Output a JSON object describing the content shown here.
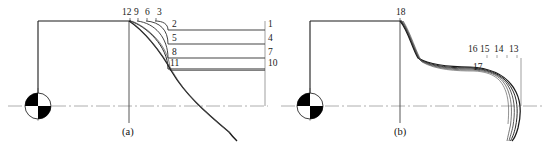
{
  "figure": {
    "width": 549,
    "height": 143,
    "background": "#ffffff",
    "line_color": "#1a1a1a",
    "centerline_color": "#8c8c8c",
    "thin_line_color": "#555555",
    "label_color": "#1a1a1a"
  },
  "panels": [
    {
      "id": "a",
      "caption": "(a)",
      "top_labels": [
        "12",
        "9",
        "6",
        "3"
      ],
      "inner_labels": [
        "2",
        "5",
        "8",
        "11"
      ],
      "outer_labels": [
        "1",
        "4",
        "7",
        "10"
      ]
    },
    {
      "id": "b",
      "caption": "(b)",
      "top_labels": [
        "18"
      ],
      "fan_labels": [
        "16",
        "15",
        "14",
        "13"
      ],
      "inner_labels": [
        "17"
      ]
    }
  ],
  "labels": {
    "a_top_12": "12",
    "a_top_9": "9",
    "a_top_6": "6",
    "a_top_3": "3",
    "a_inner_2": "2",
    "a_inner_5": "5",
    "a_inner_8": "8",
    "a_inner_11": "11",
    "a_outer_1": "1",
    "a_outer_4": "4",
    "a_outer_7": "7",
    "a_outer_10": "10",
    "b_top_18": "18",
    "b_fan_16": "16",
    "b_fan_15": "15",
    "b_fan_14": "14",
    "b_fan_13": "13",
    "b_inner_17": "17",
    "caption_a": "(a)",
    "caption_b": "(b)"
  },
  "symbols": {
    "centering_target_a": "quadrant-circle-target",
    "centering_target_b": "quadrant-circle-target"
  }
}
